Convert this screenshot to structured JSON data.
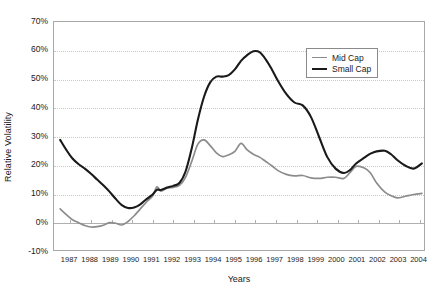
{
  "chart_data": {
    "type": "line",
    "title": "",
    "xlabel": "Years",
    "ylabel": "Relative Volatility",
    "xlim": [
      1986.7,
      2004.8
    ],
    "ylim": [
      -10,
      70
    ],
    "yticks": [
      70,
      60,
      50,
      40,
      30,
      20,
      10,
      0,
      -10
    ],
    "ytick_labels": [
      "70%",
      "60%",
      "50%",
      "40%",
      "30%",
      "20%",
      "10%",
      "0%",
      "-10%"
    ],
    "categories": [
      "1987",
      "1988",
      "1989",
      "1990",
      "1991",
      "1992",
      "1993",
      "1994",
      "1995",
      "1996",
      "1997",
      "1998",
      "1999",
      "2000",
      "2001",
      "2002",
      "2003",
      "2004"
    ],
    "grid": true,
    "legend_position": "upper right",
    "colors": {
      "mid_cap": "#8c8c8c",
      "small_cap": "#1a1a1a",
      "gridline": "#c9c9c9",
      "axis": "#a8a8a8",
      "background": "#ffffff"
    },
    "series": [
      {
        "name": "Mid  Cap",
        "color": "#8c8c8c",
        "x": [
          1987.0,
          1987.3,
          1987.6,
          1987.9,
          1988.2,
          1988.5,
          1988.8,
          1989.1,
          1989.4,
          1989.7,
          1990.0,
          1990.3,
          1990.6,
          1990.9,
          1991.2,
          1991.5,
          1991.7,
          1991.9,
          1992.2,
          1992.5,
          1992.8,
          1993.1,
          1993.4,
          1993.7,
          1994.0,
          1994.3,
          1994.6,
          1994.9,
          1995.2,
          1995.5,
          1995.8,
          1996.1,
          1996.4,
          1996.7,
          1997.0,
          1997.3,
          1997.6,
          1998.0,
          1998.4,
          1998.8,
          1999.2,
          1999.6,
          2000.0,
          2000.4,
          2000.8,
          2001.1,
          2001.4,
          2001.8,
          2002.1,
          2002.4,
          2002.8,
          2003.1,
          2003.4,
          2003.8,
          2004.2,
          2004.6
        ],
        "values": [
          5.0,
          3.0,
          1.2,
          0.2,
          -0.8,
          -1.3,
          -1.2,
          -0.7,
          0.2,
          0.0,
          -0.6,
          0.6,
          2.6,
          5.0,
          7.4,
          9.5,
          12.6,
          11.2,
          12.2,
          12.5,
          13.2,
          16.0,
          21.5,
          27.5,
          29.0,
          27.0,
          24.5,
          23.2,
          23.8,
          25.0,
          27.8,
          25.5,
          24.0,
          23.0,
          21.5,
          20.0,
          18.3,
          17.0,
          16.5,
          16.6,
          15.8,
          15.6,
          16.0,
          16.0,
          15.6,
          17.6,
          19.8,
          19.2,
          17.5,
          14.0,
          10.8,
          9.6,
          8.8,
          9.4,
          10.0,
          10.4
        ]
      },
      {
        "name": "Small  Cap",
        "color": "#1a1a1a",
        "x": [
          1987.0,
          1987.3,
          1987.6,
          1987.9,
          1988.2,
          1988.5,
          1988.8,
          1989.1,
          1989.4,
          1989.7,
          1990.0,
          1990.3,
          1990.6,
          1990.9,
          1991.2,
          1991.5,
          1991.7,
          1991.9,
          1992.2,
          1992.5,
          1992.8,
          1993.1,
          1993.4,
          1993.7,
          1994.0,
          1994.3,
          1994.6,
          1994.9,
          1995.2,
          1995.5,
          1995.8,
          1996.1,
          1996.4,
          1996.7,
          1997.0,
          1997.3,
          1997.6,
          1998.0,
          1998.4,
          1998.8,
          1999.2,
          1999.6,
          2000.0,
          2000.4,
          2000.8,
          2001.1,
          2001.4,
          2001.8,
          2002.1,
          2002.4,
          2002.8,
          2003.1,
          2003.4,
          2003.8,
          2004.2,
          2004.6
        ],
        "values": [
          29.0,
          25.5,
          22.5,
          20.5,
          19.0,
          17.2,
          15.2,
          13.2,
          11.0,
          8.5,
          6.3,
          5.3,
          5.5,
          6.6,
          8.4,
          10.0,
          11.6,
          11.6,
          12.4,
          13.0,
          14.0,
          18.0,
          26.0,
          36.0,
          44.0,
          49.0,
          51.0,
          51.0,
          51.5,
          53.5,
          56.5,
          58.5,
          59.8,
          59.5,
          57.0,
          53.5,
          49.5,
          45.0,
          42.0,
          41.0,
          37.0,
          30.0,
          23.0,
          19.0,
          17.5,
          18.5,
          20.8,
          22.8,
          24.2,
          25.0,
          25.2,
          24.0,
          22.0,
          20.0,
          19.0,
          20.8
        ]
      }
    ]
  },
  "legend": {
    "entries": [
      {
        "label": "Mid  Cap",
        "color": "#8c8c8c"
      },
      {
        "label": "Small  Cap",
        "color": "#1a1a1a"
      }
    ]
  }
}
